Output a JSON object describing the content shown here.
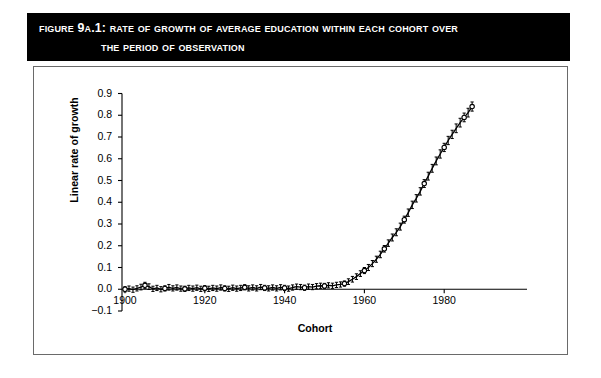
{
  "figure": {
    "label": "Figure 9A.1:",
    "title_line_1": "Rate of Growth of Average Education Within Each Cohort Over",
    "title_line_2": "the Period of Observation",
    "banner_color": "#000000",
    "banner_text_color": "#ffffff"
  },
  "chart_data": {
    "type": "line",
    "title": "Rate of Growth of Average Education Within Each Cohort Over the Period of Observation",
    "xlabel": "Cohort",
    "ylabel": "Linear rate of growth",
    "xlim": [
      1898,
      1990
    ],
    "ylim": [
      -0.1,
      0.9
    ],
    "xticks": [
      1900,
      1920,
      1940,
      1960,
      1980
    ],
    "yticks": [
      -0.1,
      0.0,
      0.1,
      0.2,
      0.3,
      0.4,
      0.5,
      0.6,
      0.7,
      0.8,
      0.9
    ],
    "xtick_labels": [
      "1900",
      "1920",
      "1940",
      "1960",
      "1980"
    ],
    "ytick_labels": [
      "-0.1",
      "0.0",
      "0.1",
      "0.2",
      "0.3",
      "0.4",
      "0.5",
      "0.6",
      "0.7",
      "0.8",
      "0.9"
    ],
    "grid": false,
    "legend": null,
    "marker": "open-circle",
    "errorbars": true,
    "series": [
      {
        "name": "Linear rate of growth",
        "x": [
          1900,
          1901,
          1902,
          1903,
          1904,
          1905,
          1906,
          1907,
          1908,
          1909,
          1910,
          1911,
          1912,
          1913,
          1914,
          1915,
          1916,
          1917,
          1918,
          1919,
          1920,
          1921,
          1922,
          1923,
          1924,
          1925,
          1926,
          1927,
          1928,
          1929,
          1930,
          1931,
          1932,
          1933,
          1934,
          1935,
          1936,
          1937,
          1938,
          1939,
          1940,
          1941,
          1942,
          1943,
          1944,
          1945,
          1946,
          1947,
          1948,
          1949,
          1950,
          1951,
          1952,
          1953,
          1954,
          1955,
          1956,
          1957,
          1958,
          1959,
          1960,
          1961,
          1962,
          1963,
          1964,
          1965,
          1966,
          1967,
          1968,
          1969,
          1970,
          1971,
          1972,
          1973,
          1974,
          1975,
          1976,
          1977,
          1978,
          1979,
          1980,
          1981,
          1982,
          1983,
          1984,
          1985,
          1986,
          1987
        ],
        "y": [
          0.0,
          0.003,
          -0.002,
          0.004,
          0.01,
          0.018,
          0.012,
          0.002,
          0.006,
          0.0,
          0.004,
          0.009,
          0.004,
          0.008,
          0.003,
          0.002,
          0.006,
          0.003,
          0.007,
          0.002,
          0.005,
          0.002,
          0.006,
          0.003,
          0.008,
          0.004,
          0.002,
          0.007,
          0.003,
          0.006,
          0.009,
          0.004,
          0.008,
          0.004,
          0.01,
          0.006,
          0.004,
          0.008,
          0.004,
          0.009,
          0.006,
          0.003,
          0.008,
          0.012,
          0.01,
          0.007,
          0.012,
          0.01,
          0.014,
          0.016,
          0.015,
          0.018,
          0.016,
          0.02,
          0.022,
          0.026,
          0.035,
          0.046,
          0.058,
          0.072,
          0.086,
          0.1,
          0.118,
          0.138,
          0.16,
          0.186,
          0.212,
          0.238,
          0.262,
          0.288,
          0.32,
          0.352,
          0.388,
          0.418,
          0.45,
          0.486,
          0.52,
          0.556,
          0.59,
          0.622,
          0.652,
          0.684,
          0.712,
          0.74,
          0.766,
          0.79,
          0.812,
          0.84
        ],
        "yerr": [
          0.012,
          0.012,
          0.012,
          0.012,
          0.013,
          0.014,
          0.013,
          0.012,
          0.012,
          0.012,
          0.012,
          0.013,
          0.012,
          0.012,
          0.012,
          0.012,
          0.012,
          0.012,
          0.012,
          0.012,
          0.012,
          0.012,
          0.012,
          0.012,
          0.012,
          0.012,
          0.012,
          0.012,
          0.012,
          0.012,
          0.012,
          0.012,
          0.012,
          0.012,
          0.012,
          0.012,
          0.012,
          0.012,
          0.012,
          0.012,
          0.012,
          0.012,
          0.012,
          0.012,
          0.012,
          0.012,
          0.012,
          0.012,
          0.012,
          0.012,
          0.012,
          0.012,
          0.012,
          0.012,
          0.012,
          0.012,
          0.013,
          0.013,
          0.013,
          0.013,
          0.014,
          0.014,
          0.014,
          0.014,
          0.015,
          0.015,
          0.015,
          0.016,
          0.016,
          0.016,
          0.016,
          0.017,
          0.017,
          0.017,
          0.017,
          0.018,
          0.018,
          0.018,
          0.018,
          0.019,
          0.019,
          0.019,
          0.019,
          0.02,
          0.02,
          0.02,
          0.02,
          0.021
        ]
      }
    ]
  }
}
